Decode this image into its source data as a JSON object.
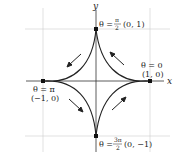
{
  "diagram": {
    "title": "",
    "axes": {
      "x_label": "x",
      "y_label": "y"
    },
    "curve": "astroid x = cos^3(theta), y = sin^3(theta)",
    "direction": "counterclockwise",
    "points": [
      {
        "id": "right",
        "theta_label": "θ = 0",
        "coord_label": "(1, 0)"
      },
      {
        "id": "top",
        "theta_prefix": "θ =",
        "theta_num": "π",
        "theta_den": "2",
        "coord_label": "(0, 1)"
      },
      {
        "id": "left",
        "theta_label": "θ = π",
        "coord_label": "(−1, 0)"
      },
      {
        "id": "bottom",
        "theta_prefix": "θ =",
        "theta_num": "3π",
        "theta_den": "2",
        "coord_label": "(0, −1)"
      }
    ],
    "colors": {
      "curve": "#222222",
      "axis": "#333333",
      "grid": "#cccccc",
      "background": "#ffffff"
    }
  }
}
